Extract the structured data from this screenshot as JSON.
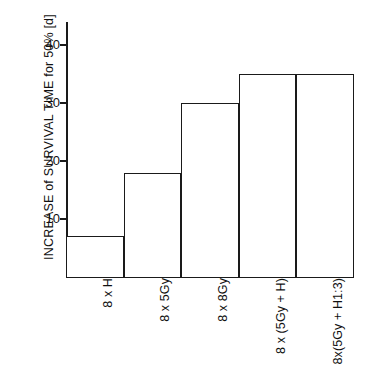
{
  "chart_data": {
    "type": "bar",
    "title": "",
    "subtitle": "",
    "xlabel": "",
    "ylabel": "INCREASE of SURVIVAL TIME for 50% [d]",
    "categories": [
      "8 x H",
      "8 x 5Gy",
      "8 x  8Gy",
      "8 x (5Gy + H)",
      "8x(5Gy + H1:3)"
    ],
    "values": [
      7,
      18,
      30,
      35,
      35
    ],
    "ylim": [
      0,
      44
    ],
    "yticks": [
      10,
      20,
      30,
      40
    ],
    "ytick_labels": [
      "10",
      "20",
      "30",
      "40"
    ],
    "grid": false,
    "legend": false,
    "legend_position": "none",
    "bar_fill_color": "#ffffff",
    "bar_edge_color": "#1a1a1a",
    "axis_color": "#1a1a1a",
    "background_color": "#ffffff"
  }
}
